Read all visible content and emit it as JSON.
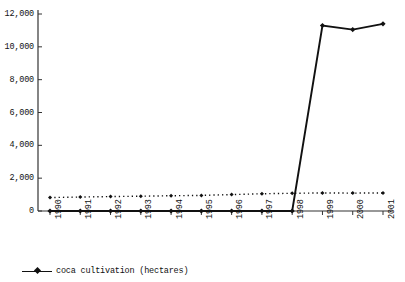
{
  "chart_data": {
    "type": "line",
    "title": "",
    "subtitle": "",
    "xlabel": "",
    "ylabel": "",
    "categories": [
      "1990",
      "1991",
      "1992",
      "1993",
      "1994",
      "1995",
      "1996",
      "1997",
      "1998",
      "1999",
      "2000",
      "2001"
    ],
    "ylim": [
      0,
      12000
    ],
    "ytick_labels": [
      "12,000",
      "10,000",
      "8,000",
      "6,000",
      "4,000",
      "2,000",
      "0"
    ],
    "ytick_values": [
      12000,
      10000,
      8000,
      6000,
      4000,
      2000,
      0
    ],
    "grid": false,
    "legend_position": "bottom-left",
    "series": [
      {
        "name": "coca cultivation (hectares)",
        "style": "solid",
        "marker": "diamond",
        "color": "#111111",
        "values": [
          0,
          0,
          0,
          0,
          0,
          0,
          0,
          0,
          0,
          11300,
          11050,
          11400
        ]
      },
      {
        "name": "reference-dotted",
        "style": "dotted",
        "marker": "diamond",
        "color": "#111111",
        "values": [
          820,
          850,
          880,
          900,
          930,
          950,
          1000,
          1050,
          1080,
          1100,
          1090,
          1100
        ]
      }
    ]
  },
  "legend": {
    "items": [
      {
        "label": "coca cultivation (hectares)"
      }
    ]
  },
  "colors": {
    "series": "#111111",
    "axis": "#333333",
    "background": "#ffffff"
  }
}
